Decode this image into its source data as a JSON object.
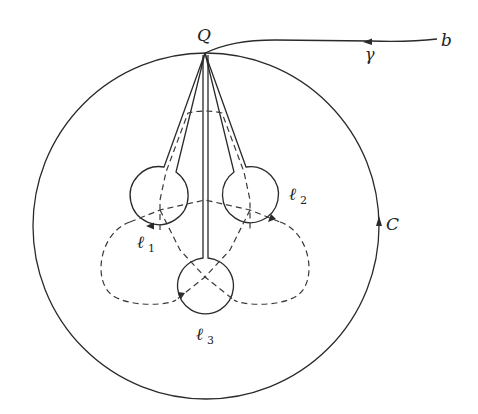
{
  "diagram": {
    "labels": {
      "Q": "Q",
      "b": "b",
      "gamma": "γ",
      "C": "C",
      "l1": "ℓ",
      "l1_sub": "1",
      "l2": "ℓ",
      "l2_sub": "2",
      "l3": "ℓ",
      "l3_sub": "3"
    },
    "nodes": [
      {
        "id": "Q",
        "label": "Q",
        "x": 205,
        "y": 53
      },
      {
        "id": "b",
        "label": "b",
        "x": 437,
        "y": 40
      }
    ],
    "curves": [
      {
        "id": "C",
        "type": "circle",
        "cx": 206,
        "cy": 226,
        "r": 173,
        "style": "solid",
        "orientation": "clockwise"
      },
      {
        "id": "gamma",
        "type": "path",
        "from": "b",
        "to": "Q",
        "style": "solid"
      },
      {
        "id": "l1",
        "type": "lasso-loop",
        "cx": 155,
        "cy": 197,
        "r": 29,
        "style": "solid"
      },
      {
        "id": "l2",
        "type": "lasso-loop",
        "cx": 255,
        "cy": 197,
        "r": 28,
        "style": "solid"
      },
      {
        "id": "l3",
        "type": "lasso-loop",
        "cx": 205,
        "cy": 285,
        "r": 28,
        "style": "solid"
      }
    ],
    "dashed_curves": 3,
    "colors": {
      "stroke": "#2a2a2a",
      "background": "#ffffff"
    }
  }
}
